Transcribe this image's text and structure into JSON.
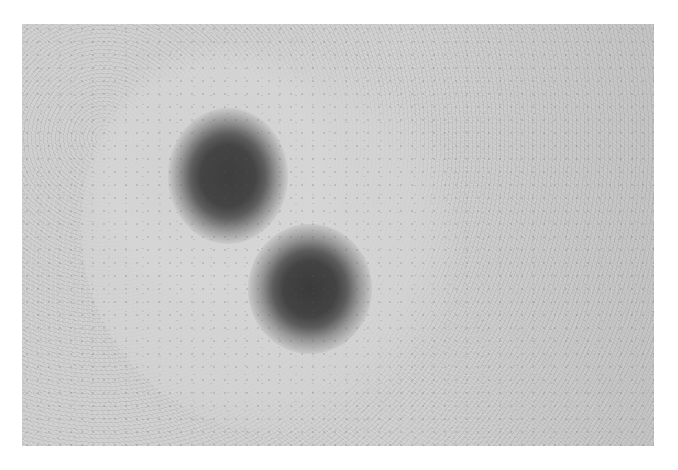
{
  "image": {
    "description": "Grayscale micrograph of a textured surface with a lighter halo region containing two dark circular spots",
    "palette": {
      "background": "#ffffff",
      "surface": "#cfcfcf",
      "halo": "#d7d7d7",
      "spot_core": "#3e3e3e"
    },
    "spots": [
      {
        "label": "upper-left spot",
        "cx": 228,
        "cy": 176,
        "r": 38
      },
      {
        "label": "lower-right spot",
        "cx": 310,
        "cy": 288,
        "r": 40
      }
    ]
  }
}
